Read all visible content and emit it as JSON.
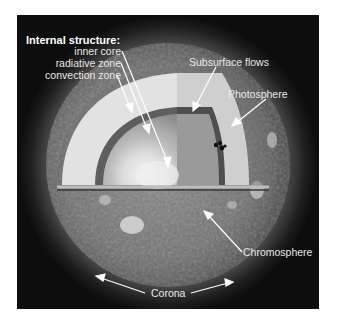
{
  "figure": {
    "background_color": "#0d0d0d",
    "label_color": "#e8e8e8"
  },
  "labels": {
    "internal_structure_heading": "Internal structure:",
    "inner_core": "inner core",
    "radiative_zone": "radiative zone",
    "convection_zone": "convection zone",
    "subsurface_flows": "Subsurface flows",
    "photosphere": "Photosphere",
    "chromosphere": "Chromosphere",
    "corona": "Corona"
  }
}
